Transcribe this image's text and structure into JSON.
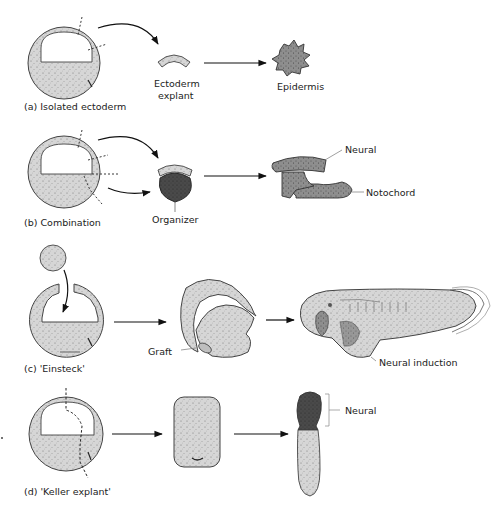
{
  "figure": {
    "panels": [
      {
        "id": "a",
        "caption": "(a)   Isolated ectoderm",
        "labels": {
          "explant": [
            "Ectoderm",
            "explant"
          ],
          "result": "Epidermis"
        }
      },
      {
        "id": "b",
        "caption": "(b)   Combination",
        "labels": {
          "organizer": "Organizer",
          "neural": "Neural",
          "notochord": "Notochord"
        }
      },
      {
        "id": "c",
        "caption": "(c)   'Einsteck'",
        "labels": {
          "graft": "Graft",
          "induction": "Neural induction"
        }
      },
      {
        "id": "d",
        "caption": "(d)   'Keller explant'",
        "labels": {
          "neural": "Neural"
        }
      }
    ],
    "colors": {
      "tissue_light": "#d9d9d9",
      "tissue_mid": "#a8a8a8",
      "tissue_dark": "#5a5a5a",
      "outline": "#3a3a3a",
      "arrow": "#111111"
    }
  }
}
